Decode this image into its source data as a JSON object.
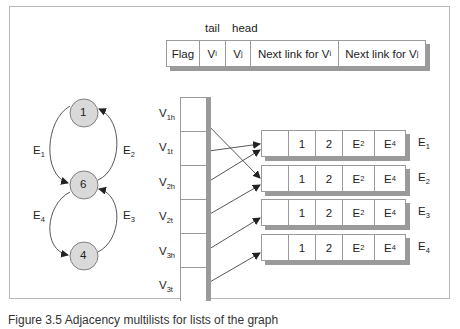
{
  "header_record": {
    "top_labels": {
      "tail": "tail",
      "head": "head"
    },
    "fields": [
      {
        "main": "Flag",
        "sub": ""
      },
      {
        "main": "V",
        "sub": "i"
      },
      {
        "main": "V",
        "sub": "j"
      },
      {
        "main": "Next link for V",
        "sub": "i"
      },
      {
        "main": "Next link for V",
        "sub": "j"
      }
    ]
  },
  "graph": {
    "nodes": [
      {
        "id": "1",
        "label": "1"
      },
      {
        "id": "6",
        "label": "6"
      },
      {
        "id": "4",
        "label": "4"
      }
    ],
    "edges": [
      {
        "main": "E",
        "sub": "1",
        "from": "1",
        "to": "6"
      },
      {
        "main": "E",
        "sub": "2",
        "from": "6",
        "to": "1"
      },
      {
        "main": "E",
        "sub": "3",
        "from": "4",
        "to": "6"
      },
      {
        "main": "E",
        "sub": "4",
        "from": "6",
        "to": "4"
      }
    ],
    "colors": {
      "node_fill": "#d9d9d9",
      "node_stroke": "#7f7f7f"
    }
  },
  "vertex_column": [
    {
      "main": "V",
      "sub": "1h"
    },
    {
      "main": "V",
      "sub": "1t"
    },
    {
      "main": "V",
      "sub": "2h"
    },
    {
      "main": "V",
      "sub": "2t"
    },
    {
      "main": "V",
      "sub": "3h"
    },
    {
      "main": "V",
      "sub": "3t"
    }
  ],
  "edge_records": [
    {
      "cells": [
        "",
        "1",
        "2",
        {
          "main": "E",
          "sub": "2"
        },
        {
          "main": "E",
          "sub": "4"
        }
      ],
      "label": {
        "main": "E",
        "sub": "1"
      }
    },
    {
      "cells": [
        "",
        "1",
        "2",
        {
          "main": "E",
          "sub": "2"
        },
        {
          "main": "E",
          "sub": "4"
        }
      ],
      "label": {
        "main": "E",
        "sub": "2"
      }
    },
    {
      "cells": [
        "",
        "1",
        "2",
        {
          "main": "E",
          "sub": "2"
        },
        {
          "main": "E",
          "sub": "4"
        }
      ],
      "label": {
        "main": "E",
        "sub": "3"
      }
    },
    {
      "cells": [
        "",
        "1",
        "2",
        {
          "main": "E",
          "sub": "2"
        },
        {
          "main": "E",
          "sub": "4"
        }
      ],
      "label": {
        "main": "E",
        "sub": "4"
      }
    }
  ],
  "edge_record_cells": {
    "c1": "1",
    "c2": "2",
    "c3_main": "E",
    "c3_sub": "2",
    "c4_main": "E",
    "c4_sub": "4"
  },
  "caption": "Figure 3.5 Adjacency multilists for lists of the graph"
}
